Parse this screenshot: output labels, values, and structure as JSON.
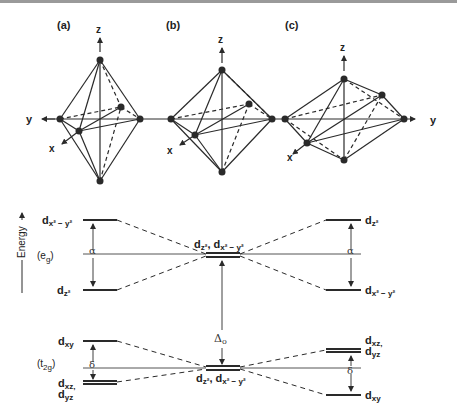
{
  "figure": {
    "panels": [
      {
        "id": "a",
        "label": "(a)",
        "description": "regular octahedron",
        "axes": {
          "z": "z",
          "y": "y",
          "x": "x"
        }
      },
      {
        "id": "b",
        "label": "(b)",
        "description": "octahedron",
        "axes": {
          "z": "z",
          "x": "x"
        }
      },
      {
        "id": "c",
        "label": "(c)",
        "description": "compressed octahedron",
        "axes": {
          "z": "z",
          "y": "y",
          "x": "x"
        }
      }
    ],
    "energy_axis_label": "Energy",
    "groups": {
      "eg": "(e",
      "eg_sub": "g",
      "eg_close": ")",
      "t2g": "(t",
      "t2g_sub": "2g",
      "t2g_close": ")"
    },
    "left": {
      "eg_upper": {
        "d": "d",
        "sub": "x² − y²"
      },
      "eg_lower": {
        "d": "d",
        "sub": "z²"
      },
      "eg_split": "α",
      "t2g_upper": {
        "d": "d",
        "sub": "xy"
      },
      "t2g_lower_1": {
        "d": "d",
        "sub": "xz,"
      },
      "t2g_lower_2": {
        "d": "d",
        "sub": "yz"
      },
      "t2g_split": "δ"
    },
    "center": {
      "eg_label": {
        "d1": "d",
        "sub1": "z²",
        "sep": ", ",
        "d2": "d",
        "sub2": "x² − y²"
      },
      "t2g_label": {
        "d1": "d",
        "sub1": "z²",
        "sep": ", ",
        "d2": "d",
        "sub2": "x² − y²"
      },
      "delta_o": "Δ",
      "delta_o_sub": "o"
    },
    "right": {
      "eg_upper": {
        "d": "d",
        "sub": "z²"
      },
      "eg_lower": {
        "d": "d",
        "sub": "x² − y²"
      },
      "eg_split": "α",
      "t2g_upper_1": {
        "d": "d",
        "sub": "xz,"
      },
      "t2g_upper_2": {
        "d": "d",
        "sub": "yz"
      },
      "t2g_lower": {
        "d": "d",
        "sub": "xy"
      },
      "t2g_split": "δ"
    }
  },
  "colors": {
    "line": "#2a2a2a",
    "background": "#ffffff",
    "top_border": "#9a9a9a"
  }
}
